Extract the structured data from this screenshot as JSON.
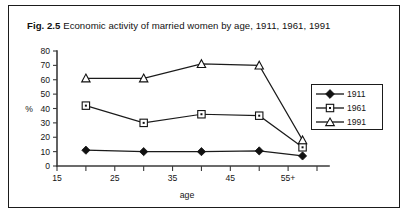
{
  "figure": {
    "number": "Fig. 2.5",
    "caption": "Economic activity of married women by age, 1911, 1961, 1991"
  },
  "chart_data": {
    "type": "line",
    "title": "Economic activity of married women by age, 1911, 1961, 1991",
    "xlabel": "age",
    "ylabel": "%",
    "xlim": [
      15,
      60
    ],
    "ylim": [
      0,
      80
    ],
    "grid": false,
    "legend_position": "right",
    "x": [
      20,
      30,
      40,
      50,
      57.5
    ],
    "x_tick_values": [
      15,
      20,
      25,
      30,
      35,
      40,
      45,
      50,
      55,
      60
    ],
    "x_tick_labels": [
      "15",
      "",
      "25",
      "",
      "35",
      "",
      "45",
      "",
      "55+",
      ""
    ],
    "y_ticks": [
      0,
      10,
      20,
      30,
      40,
      50,
      60,
      70,
      80
    ],
    "y_tick_labels": [
      "0",
      "10",
      "20",
      "30",
      "40",
      "50",
      "60",
      "70",
      "80"
    ],
    "series": [
      {
        "name": "1911",
        "marker": "filled-diamond",
        "values": [
          11,
          10,
          10,
          10.5,
          7
        ]
      },
      {
        "name": "1961",
        "marker": "open-square",
        "values": [
          42,
          30,
          36,
          35,
          13
        ]
      },
      {
        "name": "1991",
        "marker": "open-triangle",
        "values": [
          61,
          61,
          71,
          70,
          18
        ]
      }
    ]
  },
  "legend": {
    "entries": [
      {
        "label": "1911",
        "marker": "filled-diamond"
      },
      {
        "label": "1961",
        "marker": "open-square"
      },
      {
        "label": "1991",
        "marker": "open-triangle"
      }
    ]
  }
}
